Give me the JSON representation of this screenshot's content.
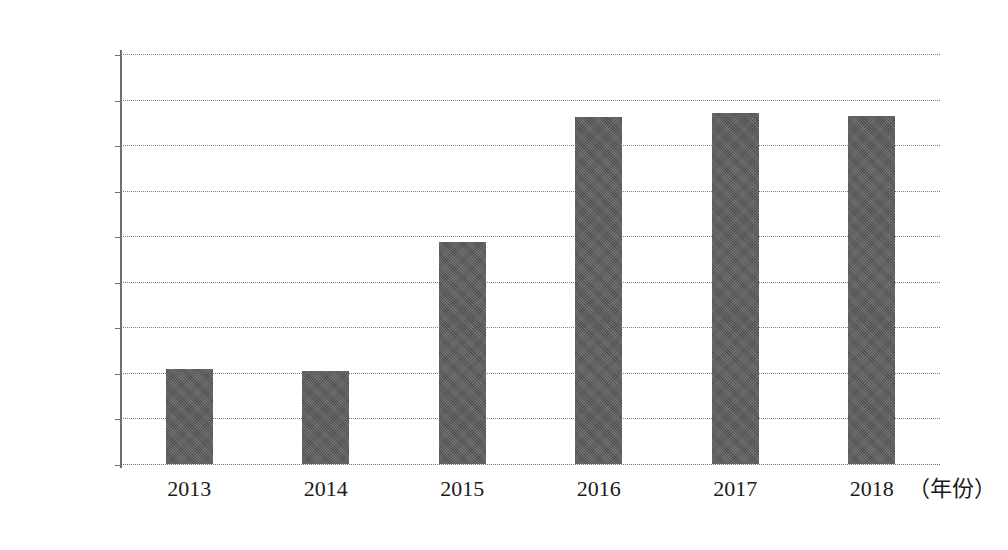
{
  "chart_data": {
    "type": "bar",
    "title": "",
    "subtitle": "",
    "xlabel": "（年份）",
    "ylabel": "",
    "categories": [
      "2013",
      "2014",
      "2015",
      "2016",
      "2017",
      "2018"
    ],
    "values": [
      10400,
      10200,
      24400,
      38100,
      38500,
      38200
    ],
    "series": [
      {
        "name": "",
        "values": [
          10400,
          10200,
          24400,
          38100,
          38500,
          38200
        ]
      }
    ],
    "ylim": [
      0,
      45000
    ],
    "y_ticks": [
      0,
      5000,
      10000,
      15000,
      20000,
      25000,
      30000,
      35000,
      40000,
      45000
    ],
    "y_tick_labels": [
      "0",
      "5000",
      "10000",
      "15000",
      "20000",
      "25000",
      "30000",
      "35000",
      "40000",
      "45000"
    ],
    "x_tick_labels": [
      "2013",
      "2014",
      "2015",
      "2016",
      "2017",
      "2018"
    ],
    "grid": true,
    "grid_axis": "y",
    "legend": false,
    "legend_position": "none",
    "annotations": [],
    "bar_color": "#585858",
    "grid_color": "#7d7d7d",
    "axis_color": "#6e6e6e",
    "background_color": "#ffffff"
  }
}
